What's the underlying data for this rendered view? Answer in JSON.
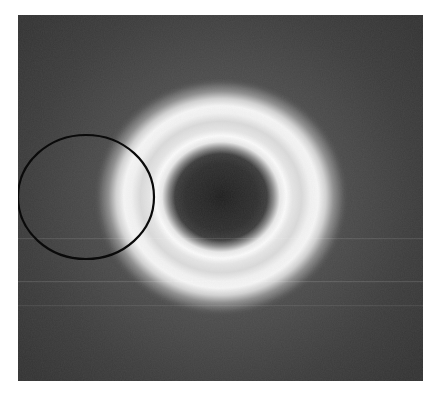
{
  "image": {
    "kind": "diffraction-ring-pattern",
    "panel": {
      "x": 18,
      "y": 15,
      "width": 405,
      "height": 366,
      "background_color": "#3a3a3a",
      "page_color": "#ffffff"
    },
    "ring": {
      "center_x": 203,
      "center_y": 182,
      "outer_radius_x": 107,
      "outer_radius_y": 100,
      "inner_radius": 52,
      "peak_color": "#f4f4f4",
      "center_color": "#2b2b2b",
      "core_color": "#1e1e1e"
    },
    "marker_ellipse": {
      "center_x": 68,
      "center_y": 182,
      "radius_x": 68,
      "radius_y": 62,
      "stroke_color": "#0a0a0a",
      "stroke_width": 2.2
    },
    "streaks": [
      {
        "y": 223,
        "opacity": 0.1
      },
      {
        "y": 266,
        "opacity": 0.12
      },
      {
        "y": 290,
        "opacity": 0.08
      }
    ]
  }
}
